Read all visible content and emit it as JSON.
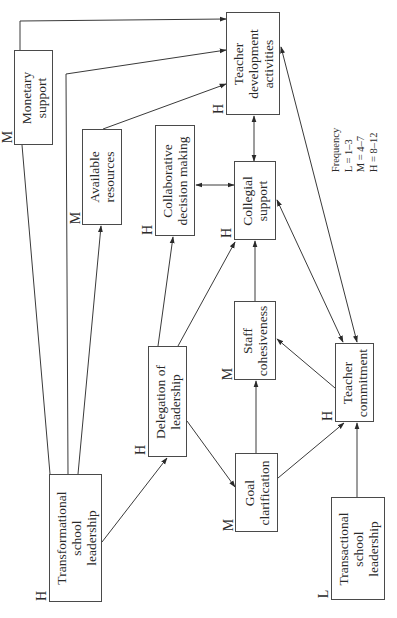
{
  "diagram": {
    "orientation": "rotated-90-ccw",
    "nodes": [
      {
        "id": "monetary",
        "label": "Monetary\nsupport",
        "frequency": "M"
      },
      {
        "id": "tda",
        "label": "Teacher\ndevelopment\nactivities",
        "frequency": "H"
      },
      {
        "id": "resources",
        "label": "Available\nresources",
        "frequency": "M"
      },
      {
        "id": "cdm",
        "label": "Collaborative\ndecision making",
        "frequency": "H"
      },
      {
        "id": "collegial",
        "label": "Collegial\nsupport",
        "frequency": "H"
      },
      {
        "id": "delegation",
        "label": "Delegation of\nleadership",
        "frequency": "H"
      },
      {
        "id": "staff",
        "label": "Staff\ncohesiveness",
        "frequency": "M"
      },
      {
        "id": "goal",
        "label": "Goal\nclarification",
        "frequency": "M"
      },
      {
        "id": "commitment",
        "label": "Teacher\ncommitment",
        "frequency": "H"
      },
      {
        "id": "transformational",
        "label": "Transformational\nschool\nleadership",
        "frequency": "H"
      },
      {
        "id": "transactional",
        "label": "Transactional\nschool\nleadership",
        "frequency": "L"
      }
    ],
    "edges": [
      {
        "from": "transformational",
        "to": "tda",
        "via": "monetary"
      },
      {
        "from": "transformational",
        "to": "tda"
      },
      {
        "from": "transformational",
        "to": "resources"
      },
      {
        "from": "resources",
        "to": "tda"
      },
      {
        "from": "transformational",
        "to": "delegation"
      },
      {
        "from": "delegation",
        "to": "cdm"
      },
      {
        "from": "delegation",
        "to": "collegial"
      },
      {
        "from": "delegation",
        "to": "goal"
      },
      {
        "from": "cdm",
        "to": "collegial",
        "bidirectional": true
      },
      {
        "from": "collegial",
        "to": "tda",
        "bidirectional": true
      },
      {
        "from": "staff",
        "to": "collegial"
      },
      {
        "from": "goal",
        "to": "staff"
      },
      {
        "from": "goal",
        "to": "commitment"
      },
      {
        "from": "commitment",
        "to": "staff"
      },
      {
        "from": "commitment",
        "to": "collegial",
        "bidirectional": true
      },
      {
        "from": "tda",
        "to": "commitment",
        "bidirectional": true
      },
      {
        "from": "transactional",
        "to": "commitment"
      }
    ],
    "legend": {
      "title": "Frequency",
      "lines": [
        "L = 1–3",
        "M = 4–7",
        "H = 8–12"
      ],
      "text": "Frequency\nL = 1–3\nM = 4–7\nH = 8–12"
    }
  }
}
